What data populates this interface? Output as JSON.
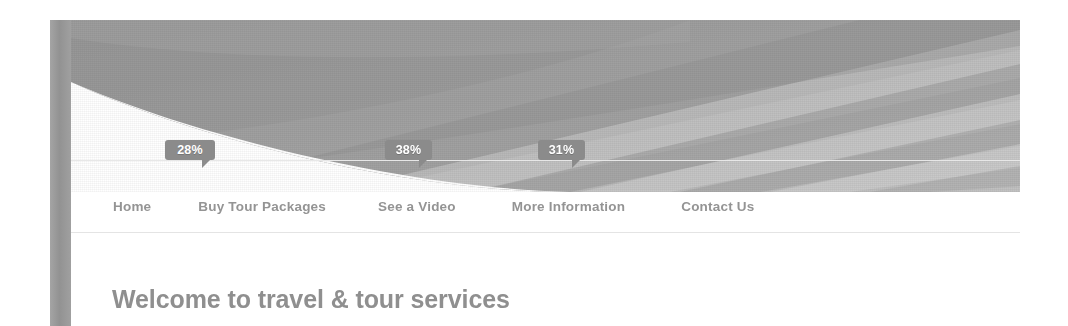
{
  "page": {
    "background_color": "#ffffff",
    "accent_gray": "#9a9a9a",
    "text_gray": "#949494",
    "heading_gray": "#8f8f8f",
    "badge_color": "#8b8b8b",
    "badge_text_color": "#ffffff",
    "divider_color": "#e4e4e4"
  },
  "banner": {
    "name": "travel-banner-graphic",
    "style": "grayscale diagonal ray swoosh",
    "bands": [
      {
        "tone": "#8f8f8f"
      },
      {
        "tone": "#a6a6a6"
      },
      {
        "tone": "#bdbdbd"
      },
      {
        "tone": "#d2d2d2"
      },
      {
        "tone": "#9b9b9b"
      },
      {
        "tone": "#b4b4b4"
      }
    ]
  },
  "badges": [
    {
      "value": "28%",
      "left": 165,
      "width": 50
    },
    {
      "value": "38%",
      "left": 385,
      "width": 47
    },
    {
      "value": "31%",
      "left": 538,
      "width": 47
    }
  ],
  "nav": {
    "items": [
      {
        "label": "Home",
        "gap": 0
      },
      {
        "label": "Buy Tour Packages",
        "gap": 47
      },
      {
        "label": "See a Video",
        "gap": 52
      },
      {
        "label": "More Information",
        "gap": 56
      },
      {
        "label": "Contact Us",
        "gap": 56
      }
    ]
  },
  "main": {
    "heading": "Welcome to travel & tour services"
  }
}
